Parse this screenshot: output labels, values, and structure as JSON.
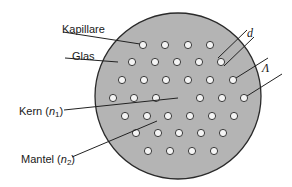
{
  "figure": {
    "type": "photonic-crystal-fiber-cross-section",
    "colors": {
      "glass_fill": "#b4b4b4",
      "outline": "#2a2a2a",
      "hole_fill": "#f4f4f4",
      "leader_line": "#222222",
      "text": "#1a1a1a"
    },
    "labels": {
      "kapillare": "Kapillare",
      "glas": "Glas",
      "kern_text": "Kern (",
      "kern_var": "n",
      "kern_sub": "1",
      "kern_close": ")",
      "mantel_text": "Mantel (",
      "mantel_var": "n",
      "mantel_sub": "2",
      "mantel_close": ")",
      "d": "d",
      "lambda": "Λ"
    },
    "hole_rows": [
      {
        "y": 45,
        "x": [
          143,
          165,
          188,
          210
        ]
      },
      {
        "y": 62,
        "x": [
          132,
          155,
          177,
          199,
          221
        ]
      },
      {
        "y": 80,
        "x": [
          122,
          144,
          166,
          188,
          210,
          233
        ]
      },
      {
        "y": 98,
        "x": [
          113,
          134,
          156,
          200,
          222,
          244
        ]
      },
      {
        "y": 116,
        "x": [
          125,
          147,
          168,
          190,
          212,
          234
        ]
      },
      {
        "y": 133,
        "x": [
          136,
          158,
          179,
          201,
          223
        ]
      },
      {
        "y": 151,
        "x": [
          148,
          170,
          192,
          214
        ]
      }
    ]
  }
}
